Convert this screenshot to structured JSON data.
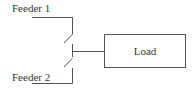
{
  "diagram": {
    "feeder1_label": "Feeder 1",
    "feeder2_label": "Feeder 2",
    "load_label": "Load",
    "line_color": "#555555",
    "text_color": "#333333"
  }
}
